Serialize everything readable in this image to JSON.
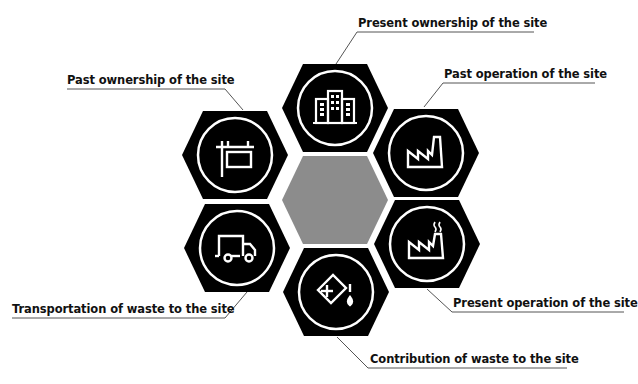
{
  "diagram": {
    "type": "hexagon-cluster",
    "colors": {
      "hex_fill": "#000000",
      "center_fill": "#8c8c8c",
      "icon_stroke": "#ffffff",
      "leader_line": "#555555",
      "text": "#111111"
    },
    "center": {
      "label": ""
    },
    "nodes": [
      {
        "id": "present-ownership",
        "label": "Present ownership of the site",
        "icon": "office-buildings-icon"
      },
      {
        "id": "past-operation",
        "label": "Past operation of the site",
        "icon": "factory-icon"
      },
      {
        "id": "present-operation",
        "label": "Present operation of the site",
        "icon": "factory-smoke-icon"
      },
      {
        "id": "contribution-waste",
        "label": "Contribution of waste to the site",
        "icon": "chemical-container-icon"
      },
      {
        "id": "transportation-waste",
        "label": "Transportation of waste to the site",
        "icon": "truck-icon"
      },
      {
        "id": "past-ownership",
        "label": "Past ownership of the site",
        "icon": "signpost-icon"
      }
    ]
  }
}
